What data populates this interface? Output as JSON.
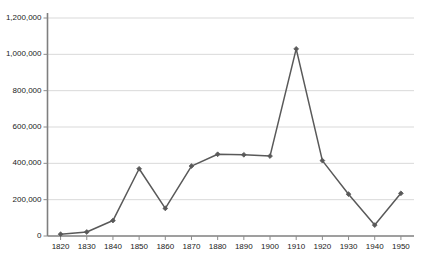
{
  "chart_data": {
    "type": "line",
    "title": "",
    "subtitle": "",
    "xlabel": "",
    "ylabel": "",
    "x": [
      1820,
      1830,
      1840,
      1850,
      1860,
      1870,
      1880,
      1890,
      1900,
      1910,
      1920,
      1930,
      1940,
      1950
    ],
    "values": [
      10000,
      22000,
      85000,
      370000,
      152000,
      385000,
      450000,
      447000,
      440000,
      1030000,
      415000,
      230000,
      60000,
      235000
    ],
    "series": [
      {
        "name": "",
        "values": [
          10000,
          22000,
          85000,
          370000,
          152000,
          385000,
          450000,
          447000,
          440000,
          1030000,
          415000,
          230000,
          60000,
          235000
        ]
      }
    ],
    "x_tick_labels": [
      "1820",
      "1830",
      "1840",
      "1850",
      "1860",
      "1870",
      "1880",
      "1890",
      "1900",
      "1910",
      "1920",
      "1930",
      "1940",
      "1950"
    ],
    "y_tick_labels": [
      "0",
      "200,000",
      "400,000",
      "600,000",
      "800,000",
      "1,000,000",
      "1,200,000"
    ],
    "y_tick_values": [
      0,
      200000,
      400000,
      600000,
      800000,
      1000000,
      1200000
    ],
    "ylim": [
      0,
      1200000
    ],
    "xlim": [
      1815,
      1955
    ],
    "grid": "horizontal",
    "legend": "none",
    "marker": "diamond",
    "line_color": "#595959",
    "marker_color": "#595959",
    "grid_color": "#d9d9d9",
    "axis_color": "#808080",
    "background_color": "#ffffff"
  },
  "artifact": {
    "bottom_left_smudge": ""
  }
}
